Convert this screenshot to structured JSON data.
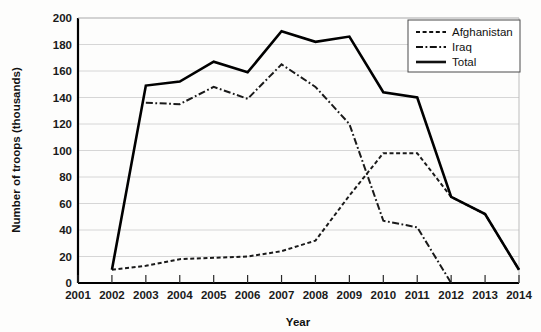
{
  "chart_data": {
    "type": "line",
    "title": "",
    "xlabel": "Year",
    "ylabel": "Number of troops (thousands)",
    "x": [
      2001,
      2002,
      2003,
      2004,
      2005,
      2006,
      2007,
      2008,
      2009,
      2010,
      2011,
      2012,
      2013,
      2014
    ],
    "xlim": [
      2001,
      2014
    ],
    "ylim": [
      0,
      200
    ],
    "ytick_labels": [
      "0",
      "20",
      "40",
      "60",
      "80",
      "100",
      "120",
      "140",
      "160",
      "180",
      "200"
    ],
    "yticks": [
      0,
      20,
      40,
      60,
      80,
      100,
      120,
      140,
      160,
      180,
      200
    ],
    "xtick_labels": [
      "2001",
      "2002",
      "2003",
      "2004",
      "2005",
      "2006",
      "2007",
      "2008",
      "2009",
      "2010",
      "2011",
      "2012",
      "2013",
      "2014"
    ],
    "grid": true,
    "grid_axis": "y",
    "legend_position": "top-right",
    "series": [
      {
        "name": "Afghanistan",
        "style": "dotted",
        "color": "#1a1a1a",
        "points": [
          {
            "x": 2002,
            "y": 10
          },
          {
            "x": 2003,
            "y": 13
          },
          {
            "x": 2004,
            "y": 18
          },
          {
            "x": 2005,
            "y": 19
          },
          {
            "x": 2006,
            "y": 20
          },
          {
            "x": 2007,
            "y": 24
          },
          {
            "x": 2008,
            "y": 32
          },
          {
            "x": 2009,
            "y": 66
          },
          {
            "x": 2010,
            "y": 98
          },
          {
            "x": 2011,
            "y": 98
          },
          {
            "x": 2012,
            "y": 65
          },
          {
            "x": 2013,
            "y": 52
          },
          {
            "x": 2014,
            "y": 10
          }
        ]
      },
      {
        "name": "Iraq",
        "style": "dash-dot",
        "color": "#1a1a1a",
        "points": [
          {
            "x": 2003,
            "y": 136
          },
          {
            "x": 2004,
            "y": 135
          },
          {
            "x": 2005,
            "y": 148
          },
          {
            "x": 2006,
            "y": 139
          },
          {
            "x": 2007,
            "y": 165
          },
          {
            "x": 2008,
            "y": 148
          },
          {
            "x": 2009,
            "y": 120
          },
          {
            "x": 2010,
            "y": 47
          },
          {
            "x": 2011,
            "y": 42
          },
          {
            "x": 2012,
            "y": 0
          }
        ]
      },
      {
        "name": "Total",
        "style": "solid",
        "color": "#000000",
        "points": [
          {
            "x": 2002,
            "y": 10
          },
          {
            "x": 2003,
            "y": 149
          },
          {
            "x": 2004,
            "y": 152
          },
          {
            "x": 2005,
            "y": 167
          },
          {
            "x": 2006,
            "y": 159
          },
          {
            "x": 2007,
            "y": 190
          },
          {
            "x": 2008,
            "y": 182
          },
          {
            "x": 2009,
            "y": 186
          },
          {
            "x": 2010,
            "y": 144
          },
          {
            "x": 2011,
            "y": 140
          },
          {
            "x": 2012,
            "y": 65
          },
          {
            "x": 2013,
            "y": 52
          },
          {
            "x": 2014,
            "y": 10
          }
        ]
      }
    ],
    "legend": [
      {
        "label": "Afghanistan",
        "style": "dotted"
      },
      {
        "label": "Iraq",
        "style": "dash-dot"
      },
      {
        "label": "Total",
        "style": "solid"
      }
    ]
  }
}
